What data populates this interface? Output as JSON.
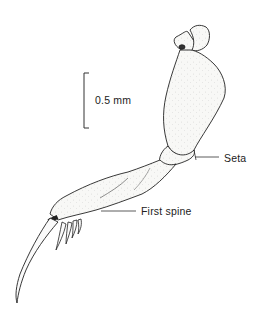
{
  "figure": {
    "scale_bar": {
      "label": "0.5 mm"
    },
    "annotations": [
      {
        "id": "seta",
        "label": "Seta"
      },
      {
        "id": "first-spine",
        "label": "First spine"
      }
    ],
    "colors": {
      "ink": "#222222",
      "fill": "#f7f7f5",
      "background": "#ffffff"
    }
  }
}
